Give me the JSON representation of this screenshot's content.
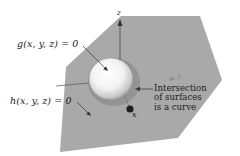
{
  "figure": {
    "labels": {
      "g_surface": "g(x, y, z) = 0",
      "h_surface": "h(x, y, z) = 0",
      "intersection_line1": "Intersection",
      "intersection_line2": "of surfaces",
      "intersection_line3": "is a curve",
      "z_axis": "z",
      "y_axis": "y",
      "x_axis": "x"
    },
    "colors": {
      "plane": "#a9a9a9",
      "sphere_light": "#ffffff",
      "sphere_dark": "#9a9a9a",
      "intersection_ring": "#8f8f8f",
      "axis": "#333333",
      "text": "#222222",
      "point": "#1e1e1e"
    }
  }
}
